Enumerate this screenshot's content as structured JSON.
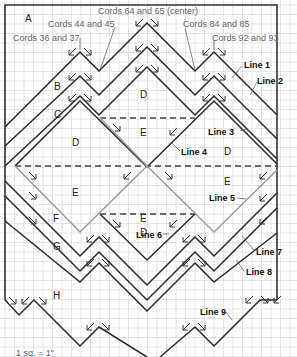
{
  "scale_note": "1 sq. = 1\"",
  "cord_labels": [
    {
      "id": "cords-36-37",
      "text": "Cords 36 and 37"
    },
    {
      "id": "cords-44-45",
      "text": "Cords 44 and 45"
    },
    {
      "id": "cords-64-65",
      "text": "Cords 64 and 65 (center)"
    },
    {
      "id": "cords-84-85",
      "text": "Cords 84 and 85"
    },
    {
      "id": "cords-92-93",
      "text": "Cords 92 and 93"
    }
  ],
  "line_labels": [
    "Line 1",
    "Line 2",
    "Line 3",
    "Line 4",
    "Line 5",
    "Line 6",
    "Line 7",
    "Line 8",
    "Line 9"
  ],
  "region_labels": {
    "A": "A",
    "B": "B",
    "C": "C",
    "D": "D",
    "E": "E",
    "F": "F",
    "G": "G",
    "H": "H"
  }
}
